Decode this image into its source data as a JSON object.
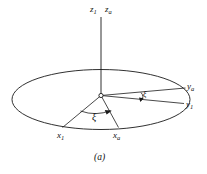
{
  "figure": {
    "caption": "(a)"
  },
  "axes": [
    {
      "id": "z1",
      "base": "z",
      "sub": "1",
      "name": "axis-label-z1"
    },
    {
      "id": "za",
      "base": "z",
      "sub": "a",
      "name": "axis-label-za"
    },
    {
      "id": "ya",
      "base": "y",
      "sub": "a",
      "name": "axis-label-ya"
    },
    {
      "id": "y1",
      "base": "y",
      "sub": "1",
      "name": "axis-label-y1"
    },
    {
      "id": "x1",
      "base": "x",
      "sub": "1",
      "name": "axis-label-x1"
    },
    {
      "id": "xa",
      "base": "x",
      "sub": "a",
      "name": "axis-label-xa"
    }
  ],
  "angles": [
    {
      "id": "xi-x",
      "symbol": "ξ",
      "name": "angle-label-xi-x"
    },
    {
      "id": "xi-y",
      "symbol": "ξ",
      "name": "angle-label-xi-y"
    }
  ],
  "style": {
    "stroke": "#1a1a1a",
    "background": "#ffffff",
    "text": "#111111"
  }
}
